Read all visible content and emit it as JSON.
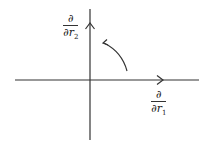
{
  "diagram": {
    "title": "",
    "colors": {
      "axis": "#333333",
      "background": "#ffffff"
    },
    "axes": {
      "horizontal": {
        "x1": 15,
        "y": 80,
        "x2": 199,
        "arrow_at_x": 162,
        "label": {
          "numerator": "∂",
          "denominator_base": "∂r",
          "denominator_sub": "1"
        }
      },
      "vertical": {
        "x": 90,
        "y1": 10,
        "y2": 139,
        "arrow_at_y": 25,
        "label": {
          "numerator": "∂",
          "denominator_base": "∂r",
          "denominator_sub": "2"
        }
      }
    },
    "rotation_arrow": {
      "description": "counter-clockwise rotation from r1 direction toward r2 direction",
      "start": [
        127,
        71
      ],
      "end": [
        103,
        43
      ]
    }
  }
}
